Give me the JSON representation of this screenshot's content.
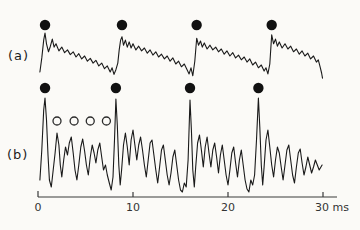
{
  "figure": {
    "trace_a": {
      "label": "(a)"
    },
    "trace_b": {
      "label": "(b)"
    }
  },
  "colors": {
    "line": "#1a1a1a",
    "marker_fill": "#111111",
    "open_marker_stroke": "#2b2b2b",
    "axis": "#3a3a3a",
    "text": "#333333",
    "background": "#fbfaf7"
  },
  "chart_data": {
    "type": "line",
    "title": "",
    "xlabel": "ms",
    "xlim": [
      0,
      30
    ],
    "x_ticks": [
      {
        "value": 0,
        "label": "0"
      },
      {
        "value": 10,
        "label": "10"
      },
      {
        "value": 20,
        "label": "20"
      },
      {
        "value": 30,
        "label": "30 ms"
      }
    ],
    "grid": false,
    "legend": "none",
    "series": [
      {
        "name": "(a)",
        "description": "slow noisy waveform with sharp onsets, pitch marks (filled dots) above each onset peak",
        "markers_filled_ms": [
          0.74,
          8.84,
          16.7,
          24.6
        ],
        "points": [
          [
            0.2,
            17
          ],
          [
            0.4,
            47
          ],
          [
            0.6,
            85
          ],
          [
            0.74,
            100
          ],
          [
            0.9,
            77
          ],
          [
            1.1,
            60
          ],
          [
            1.3,
            72
          ],
          [
            1.5,
            87
          ],
          [
            1.7,
            70
          ],
          [
            1.9,
            77
          ],
          [
            2.2,
            62
          ],
          [
            2.5,
            70
          ],
          [
            2.8,
            58
          ],
          [
            3.1,
            64
          ],
          [
            3.4,
            54
          ],
          [
            3.7,
            60
          ],
          [
            4.0,
            49
          ],
          [
            4.3,
            56
          ],
          [
            4.6,
            45
          ],
          [
            4.9,
            51
          ],
          [
            5.2,
            40
          ],
          [
            5.5,
            46
          ],
          [
            5.8,
            36
          ],
          [
            6.1,
            42
          ],
          [
            6.4,
            30
          ],
          [
            6.7,
            36
          ],
          [
            7.0,
            24
          ],
          [
            7.3,
            30
          ],
          [
            7.6,
            17
          ],
          [
            7.8,
            26
          ],
          [
            8.0,
            12
          ],
          [
            8.2,
            22
          ],
          [
            8.4,
            36
          ],
          [
            8.55,
            64
          ],
          [
            8.7,
            85
          ],
          [
            8.84,
            92
          ],
          [
            9.0,
            74
          ],
          [
            9.2,
            85
          ],
          [
            9.4,
            70
          ],
          [
            9.6,
            81
          ],
          [
            9.8,
            68
          ],
          [
            10.0,
            77
          ],
          [
            10.3,
            64
          ],
          [
            10.6,
            72
          ],
          [
            10.9,
            62
          ],
          [
            11.2,
            68
          ],
          [
            11.5,
            57
          ],
          [
            11.8,
            64
          ],
          [
            12.1,
            53
          ],
          [
            12.4,
            60
          ],
          [
            12.7,
            49
          ],
          [
            13.0,
            55
          ],
          [
            13.3,
            45
          ],
          [
            13.6,
            51
          ],
          [
            13.9,
            40
          ],
          [
            14.2,
            47
          ],
          [
            14.5,
            34
          ],
          [
            14.8,
            40
          ],
          [
            15.1,
            28
          ],
          [
            15.4,
            34
          ],
          [
            15.7,
            21
          ],
          [
            15.9,
            13
          ],
          [
            16.1,
            26
          ],
          [
            16.3,
            9
          ],
          [
            16.5,
            40
          ],
          [
            16.7,
            89
          ],
          [
            16.9,
            74
          ],
          [
            17.1,
            83
          ],
          [
            17.3,
            70
          ],
          [
            17.5,
            79
          ],
          [
            17.8,
            66
          ],
          [
            18.1,
            74
          ],
          [
            18.4,
            64
          ],
          [
            18.7,
            70
          ],
          [
            19.0,
            60
          ],
          [
            19.3,
            66
          ],
          [
            19.6,
            55
          ],
          [
            19.9,
            62
          ],
          [
            20.2,
            51
          ],
          [
            20.5,
            58
          ],
          [
            20.8,
            47
          ],
          [
            21.1,
            53
          ],
          [
            21.4,
            43
          ],
          [
            21.7,
            49
          ],
          [
            22.0,
            38
          ],
          [
            22.3,
            45
          ],
          [
            22.6,
            32
          ],
          [
            22.9,
            38
          ],
          [
            23.2,
            26
          ],
          [
            23.5,
            32
          ],
          [
            23.8,
            19
          ],
          [
            24.0,
            26
          ],
          [
            24.2,
            13
          ],
          [
            24.4,
            34
          ],
          [
            24.6,
            96
          ],
          [
            24.8,
            77
          ],
          [
            25.0,
            87
          ],
          [
            25.2,
            72
          ],
          [
            25.4,
            81
          ],
          [
            25.7,
            68
          ],
          [
            26.0,
            77
          ],
          [
            26.3,
            66
          ],
          [
            26.6,
            72
          ],
          [
            26.9,
            60
          ],
          [
            27.2,
            66
          ],
          [
            27.5,
            55
          ],
          [
            27.8,
            62
          ],
          [
            28.1,
            51
          ],
          [
            28.4,
            57
          ],
          [
            28.7,
            45
          ],
          [
            29.0,
            51
          ],
          [
            29.3,
            38
          ],
          [
            29.5,
            43
          ],
          [
            29.7,
            28
          ],
          [
            29.85,
            15
          ],
          [
            29.95,
            4
          ]
        ]
      },
      {
        "name": "(b)",
        "description": "spiky residual waveform; tall spikes marked with filled dots, first four secondary peaks marked with open circles",
        "markers_filled_ms": [
          0.74,
          8.2,
          16.0,
          23.2
        ],
        "markers_open_ms": [
          2.0,
          3.8,
          5.5,
          7.2
        ],
        "points": [
          [
            0.2,
            15
          ],
          [
            0.4,
            45
          ],
          [
            0.6,
            85
          ],
          [
            0.74,
            97
          ],
          [
            0.9,
            75
          ],
          [
            1.05,
            40
          ],
          [
            1.2,
            15
          ],
          [
            1.4,
            8
          ],
          [
            1.6,
            25
          ],
          [
            1.8,
            42
          ],
          [
            2.0,
            62
          ],
          [
            2.2,
            50
          ],
          [
            2.35,
            30
          ],
          [
            2.5,
            18
          ],
          [
            2.7,
            35
          ],
          [
            2.9,
            48
          ],
          [
            3.1,
            40
          ],
          [
            3.3,
            52
          ],
          [
            3.5,
            58
          ],
          [
            3.7,
            42
          ],
          [
            3.9,
            25
          ],
          [
            4.1,
            15
          ],
          [
            4.3,
            30
          ],
          [
            4.5,
            48
          ],
          [
            4.7,
            56
          ],
          [
            4.9,
            44
          ],
          [
            5.1,
            30
          ],
          [
            5.3,
            20
          ],
          [
            5.5,
            38
          ],
          [
            5.7,
            50
          ],
          [
            5.9,
            42
          ],
          [
            6.1,
            32
          ],
          [
            6.3,
            45
          ],
          [
            6.5,
            52
          ],
          [
            6.7,
            38
          ],
          [
            6.9,
            25
          ],
          [
            7.1,
            30
          ],
          [
            7.3,
            20
          ],
          [
            7.5,
            12
          ],
          [
            7.7,
            5
          ],
          [
            7.9,
            18
          ],
          [
            8.05,
            55
          ],
          [
            8.2,
            96
          ],
          [
            8.35,
            70
          ],
          [
            8.5,
            30
          ],
          [
            8.65,
            10
          ],
          [
            8.8,
            25
          ],
          [
            9.0,
            50
          ],
          [
            9.2,
            62
          ],
          [
            9.4,
            48
          ],
          [
            9.6,
            30
          ],
          [
            9.8,
            55
          ],
          [
            10.0,
            65
          ],
          [
            10.2,
            50
          ],
          [
            10.4,
            35
          ],
          [
            10.6,
            50
          ],
          [
            10.8,
            58
          ],
          [
            11.0,
            45
          ],
          [
            11.2,
            30
          ],
          [
            11.4,
            18
          ],
          [
            11.6,
            35
          ],
          [
            11.8,
            52
          ],
          [
            12.0,
            55
          ],
          [
            12.2,
            40
          ],
          [
            12.4,
            25
          ],
          [
            12.6,
            12
          ],
          [
            12.8,
            28
          ],
          [
            13.0,
            45
          ],
          [
            13.2,
            50
          ],
          [
            13.4,
            35
          ],
          [
            13.6,
            20
          ],
          [
            13.8,
            10
          ],
          [
            14.0,
            22
          ],
          [
            14.2,
            38
          ],
          [
            14.4,
            45
          ],
          [
            14.6,
            30
          ],
          [
            14.8,
            15
          ],
          [
            15.0,
            5
          ],
          [
            15.2,
            3
          ],
          [
            15.4,
            12
          ],
          [
            15.6,
            8
          ],
          [
            15.8,
            35
          ],
          [
            16.0,
            95
          ],
          [
            16.15,
            65
          ],
          [
            16.3,
            25
          ],
          [
            16.45,
            8
          ],
          [
            16.6,
            28
          ],
          [
            16.8,
            52
          ],
          [
            17.0,
            60
          ],
          [
            17.2,
            45
          ],
          [
            17.4,
            28
          ],
          [
            17.6,
            48
          ],
          [
            17.8,
            58
          ],
          [
            18.0,
            42
          ],
          [
            18.2,
            28
          ],
          [
            18.4,
            45
          ],
          [
            18.6,
            52
          ],
          [
            18.8,
            38
          ],
          [
            19.0,
            22
          ],
          [
            19.2,
            40
          ],
          [
            19.4,
            50
          ],
          [
            19.6,
            35
          ],
          [
            19.8,
            20
          ],
          [
            20.0,
            10
          ],
          [
            20.2,
            25
          ],
          [
            20.4,
            42
          ],
          [
            20.6,
            48
          ],
          [
            20.8,
            32
          ],
          [
            21.0,
            18
          ],
          [
            21.2,
            35
          ],
          [
            21.4,
            45
          ],
          [
            21.6,
            30
          ],
          [
            21.8,
            15
          ],
          [
            22.0,
            6
          ],
          [
            22.2,
            3
          ],
          [
            22.4,
            15
          ],
          [
            22.6,
            10
          ],
          [
            22.8,
            20
          ],
          [
            23.0,
            55
          ],
          [
            23.2,
            97
          ],
          [
            23.35,
            68
          ],
          [
            23.5,
            30
          ],
          [
            23.65,
            10
          ],
          [
            23.8,
            28
          ],
          [
            24.0,
            55
          ],
          [
            24.2,
            65
          ],
          [
            24.4,
            48
          ],
          [
            24.6,
            30
          ],
          [
            24.8,
            18
          ],
          [
            25.0,
            35
          ],
          [
            25.2,
            48
          ],
          [
            25.4,
            42
          ],
          [
            25.6,
            28
          ],
          [
            25.8,
            15
          ],
          [
            26.0,
            30
          ],
          [
            26.2,
            45
          ],
          [
            26.4,
            50
          ],
          [
            26.6,
            35
          ],
          [
            26.8,
            20
          ],
          [
            27.0,
            12
          ],
          [
            27.2,
            28
          ],
          [
            27.4,
            42
          ],
          [
            27.6,
            46
          ],
          [
            27.8,
            32
          ],
          [
            28.0,
            20
          ],
          [
            28.2,
            28
          ],
          [
            28.4,
            38
          ],
          [
            28.6,
            30
          ],
          [
            28.8,
            22
          ],
          [
            29.0,
            28
          ],
          [
            29.2,
            35
          ],
          [
            29.4,
            30
          ],
          [
            29.6,
            25
          ],
          [
            29.9,
            30
          ]
        ]
      }
    ]
  }
}
